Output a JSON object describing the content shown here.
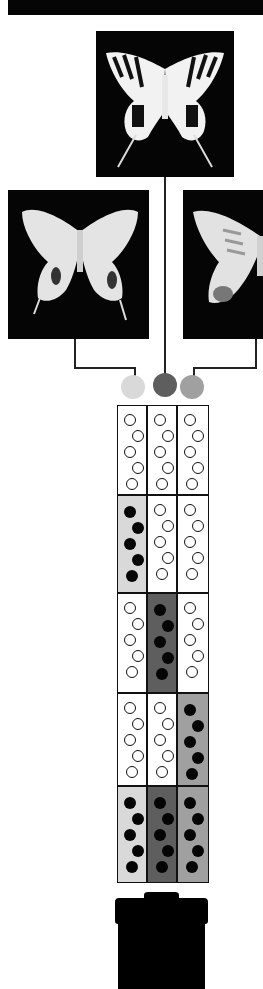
{
  "figure": {
    "butterflies": [
      {
        "id": "top",
        "label": "",
        "pattern": "striped-swallowtail"
      },
      {
        "id": "left",
        "label": "",
        "pattern": "pale-mimic"
      },
      {
        "id": "right",
        "label": "",
        "pattern": "pale-mimic-variant"
      }
    ],
    "alleles": [
      {
        "id": "light",
        "color": "#d9d9d9"
      },
      {
        "id": "dark",
        "color": "#5e5e5e"
      },
      {
        "id": "medium",
        "color": "#a0a0a0"
      }
    ],
    "grid": {
      "columns": 3,
      "rows": [
        {
          "cells": [
            {
              "fill": "#ffffff",
              "dots": "open"
            },
            {
              "fill": "#ffffff",
              "dots": "open"
            },
            {
              "fill": "#ffffff",
              "dots": "open"
            }
          ]
        },
        {
          "cells": [
            {
              "fill": "#d9d9d9",
              "dots": "filled"
            },
            {
              "fill": "#ffffff",
              "dots": "open"
            },
            {
              "fill": "#ffffff",
              "dots": "open"
            }
          ]
        },
        {
          "cells": [
            {
              "fill": "#ffffff",
              "dots": "open"
            },
            {
              "fill": "#5e5e5e",
              "dots": "filled"
            },
            {
              "fill": "#ffffff",
              "dots": "open"
            }
          ]
        },
        {
          "cells": [
            {
              "fill": "#ffffff",
              "dots": "open"
            },
            {
              "fill": "#ffffff",
              "dots": "open"
            },
            {
              "fill": "#a0a0a0",
              "dots": "filled"
            }
          ]
        },
        {
          "cells": [
            {
              "fill": "#d9d9d9",
              "dots": "filled"
            },
            {
              "fill": "#5e5e5e",
              "dots": "filled"
            },
            {
              "fill": "#a0a0a0",
              "dots": "filled"
            }
          ]
        }
      ]
    },
    "colors": {
      "frame": "#050505",
      "line": "#222222",
      "container": "#000000"
    }
  }
}
